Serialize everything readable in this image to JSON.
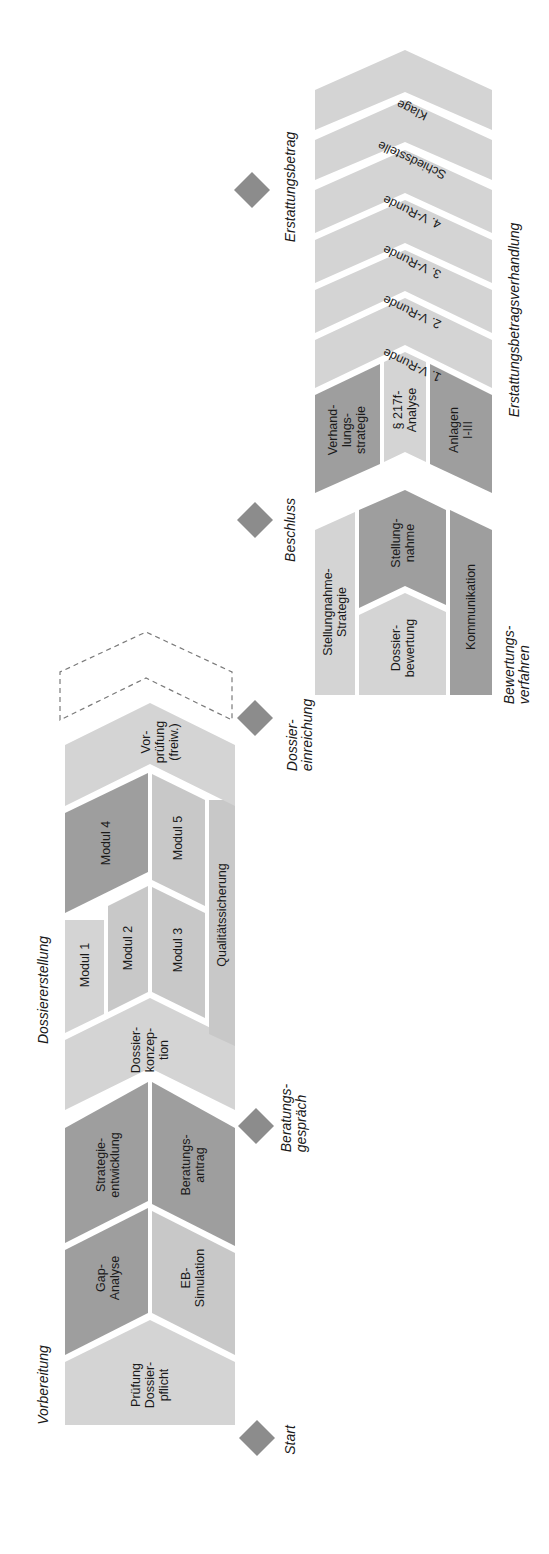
{
  "colors": {
    "light": "#d4d4d4",
    "medium": "#c6c6c6",
    "dark": "#9d9d9d",
    "milestone": "#8c8c8c",
    "dashed": "#7a7a7a",
    "background": "#ffffff"
  },
  "phases": {
    "vorbereitung": "Vorbereitung",
    "dossiererstellung": "Dossiererstellung",
    "bewertungsverfahren": "Bewertungs-\nverfahren",
    "erstattungsbetragsverhandlung": "Erstattungsbetragsverhandlung"
  },
  "milestones": {
    "start": "Start",
    "beratungsgespraech": "Beratungs-\ngespräch",
    "dossiereinreichung": "Dossier-\neinreichung",
    "beschluss": "Beschluss",
    "erstattungsbetrag": "Erstattungsbetrag"
  },
  "blocks": {
    "pruefung_dossierpflicht": "Prüfung\nDossier-\npflicht",
    "gap_analyse": "Gap-\nAnalyse",
    "eb_simulation": "EB-\nSimulation",
    "strategieentwicklung": "Strategie-\nentwicklung",
    "beratungsantrag": "Beratungs-\nantrag",
    "dossierkonzeption": "Dossier-\nkonzep-\ntion",
    "modul1": "Modul 1",
    "modul2": "Modul 2",
    "modul3": "Modul 3",
    "modul4": "Modul 4",
    "modul5": "Modul 5",
    "qualitaetssicherung": "Qualitätssicherung",
    "vorpruefung": "Vor-\nprüfung\n(freiw.)",
    "stellungnahme_strategie": "Stellungnahme-\nStrategie",
    "dossierbewertung": "Dossier-\nbewertung",
    "stellungnahme": "Stellung-\nnahme",
    "kommunikation": "Kommunikation",
    "verhandlungsstrategie": "Verhand-\nlungs-\nstrategie",
    "p217f_analyse": "§ 217f-\nAnalyse",
    "anlagen": "Anlagen\nI-III",
    "runde1": "1. V-Runde",
    "runde2": "2. V-Runde",
    "runde3": "3. V-Runde",
    "runde4": "4. V-Runde",
    "schiedsstelle": "Schiedsstelle",
    "klage": "Klage"
  }
}
